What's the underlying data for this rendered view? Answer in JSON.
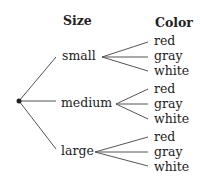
{
  "headers": {
    "size": "Size",
    "color": "Color"
  },
  "sizes": [
    {
      "label": "small",
      "colors": [
        "red",
        "gray",
        "white"
      ]
    },
    {
      "label": "medium",
      "colors": [
        "red",
        "gray",
        "white"
      ]
    },
    {
      "label": "large",
      "colors": [
        "red",
        "gray",
        "white"
      ]
    }
  ],
  "line_color": "#555555",
  "root_dot_color": "#222222"
}
